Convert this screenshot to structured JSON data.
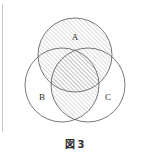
{
  "figure": {
    "caption_label": "図",
    "caption_number": "3",
    "caption_full": "図 3",
    "frame_color": "#a8a8a8",
    "background_color": "#ffffff",
    "stroke_color": "#555555",
    "hatch_color": "#8a8a8a",
    "label_color": "#2b2b2b"
  },
  "diagram": {
    "type": "venn",
    "set_count": 3,
    "viewbox": "0 0 123 126",
    "circles": [
      {
        "id": "A",
        "label": "A",
        "cx": 62,
        "cy": 46,
        "r": 37,
        "label_x": 62,
        "label_y": 29
      },
      {
        "id": "B",
        "label": "B",
        "cx": 49,
        "cy": 76,
        "r": 37,
        "label_x": 29,
        "label_y": 89
      },
      {
        "id": "C",
        "label": "C",
        "cx": 75,
        "cy": 76,
        "r": 37,
        "label_x": 95,
        "label_y": 89
      }
    ],
    "shaded_description": "A union (B intersect C)",
    "shaded_regions": [
      {
        "id": "region-A",
        "expression": "A"
      },
      {
        "id": "region-B-and-C",
        "expression": "B ∩ C"
      }
    ],
    "hatch": {
      "pattern": "diagonal-lines",
      "direction": "up-right",
      "angle_degrees": 45,
      "spacing_px": 3,
      "line_width_px": 0.6
    }
  }
}
